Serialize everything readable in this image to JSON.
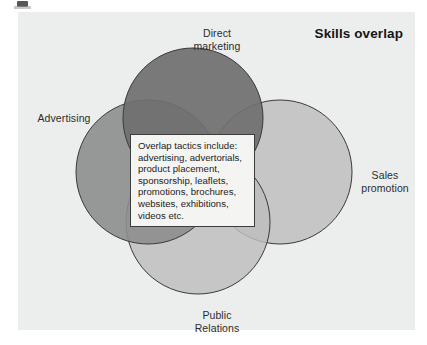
{
  "figure": {
    "title": "Skills overlap",
    "background_color": "#eceded",
    "labels": {
      "top": "Direct\nmarketing",
      "left": "Advertising",
      "right": "Sales\npromotion",
      "bottom": "Public\nRelations"
    },
    "callout": {
      "text": "Overlap tactics include:\nadvertising, advertorials,\nproduct placement,\nsponsorship, leaflets,\npromotions, brochures,\nwebsites, exhibitions,\nvideos etc.",
      "border_color": "#3d3d3d",
      "fill_color": "#f4f4f2"
    }
  },
  "chart_data": {
    "type": "venn",
    "title": "Skills overlap",
    "xlabel": "",
    "ylabel": "",
    "legend_position": "none",
    "grid": false,
    "sets": [
      {
        "name": "Direct marketing",
        "label": "Direct\nmarketing",
        "position": "top",
        "cx": 175,
        "cy": 106,
        "r": 70,
        "fill": "#6f6f6f",
        "stroke": "#3a3a3a",
        "label_x": 199,
        "label_y": 21
      },
      {
        "name": "Advertising",
        "label": "Advertising",
        "position": "left",
        "cx": 130,
        "cy": 160,
        "r": 72,
        "fill": "#8d8d8d",
        "stroke": "#3a3a3a",
        "label_x": 46,
        "label_y": 106
      },
      {
        "name": "Sales promotion",
        "label": "Sales\npromotion",
        "position": "right",
        "cx": 262,
        "cy": 160,
        "r": 72,
        "fill": "#c6c6c6",
        "stroke": "#3a3a3a",
        "label_x": 367,
        "label_y": 163
      },
      {
        "name": "Public Relations",
        "label": "Public\nRelations",
        "position": "bottom",
        "cx": 180,
        "cy": 210,
        "r": 72,
        "fill": "#bdbdbd",
        "stroke": "#3a3a3a",
        "label_x": 199,
        "label_y": 303
      }
    ],
    "intersection_note": "Overlap tactics include: advertising, advertorials, product placement, sponsorship, leaflets, promotions, brochures, websites, exhibitions, videos etc."
  }
}
